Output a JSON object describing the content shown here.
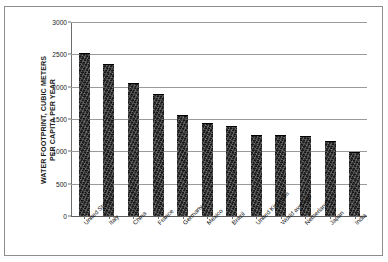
{
  "figure": {
    "top_strip_text": "",
    "background": "#ffffff",
    "frame_color": "#8d8d8d"
  },
  "chart_data": {
    "type": "bar",
    "title": "",
    "xlabel": "",
    "ylabel": "WATER FOOTPRINT, CUBIC METERS PER CAPITA PER YEAR",
    "ylabel_line1": "WATER FOOTPRINT, CUBIC METERS",
    "ylabel_line2": "PER CAPITA PER YEAR",
    "categories": [
      "United States",
      "Italy",
      "China",
      "France",
      "Germany",
      "Mexico",
      "Brazil",
      "United Kingdom",
      "World average",
      "Netherlands",
      "Japan",
      "India"
    ],
    "values": [
      2500,
      2340,
      2040,
      1870,
      1540,
      1430,
      1380,
      1240,
      1240,
      1220,
      1140,
      970
    ],
    "ylim": [
      0,
      3000
    ],
    "yticks": [
      0,
      500,
      1000,
      1500,
      2000,
      2500,
      3000
    ],
    "ytick_labels": [
      "0",
      "500",
      "1000",
      "1500",
      "2000",
      "2500",
      "3000"
    ],
    "grid": true,
    "legend": false,
    "bar_color": "#161616",
    "gridline_color": "#9a9a9a",
    "axis_color": "#6d6d6d"
  }
}
